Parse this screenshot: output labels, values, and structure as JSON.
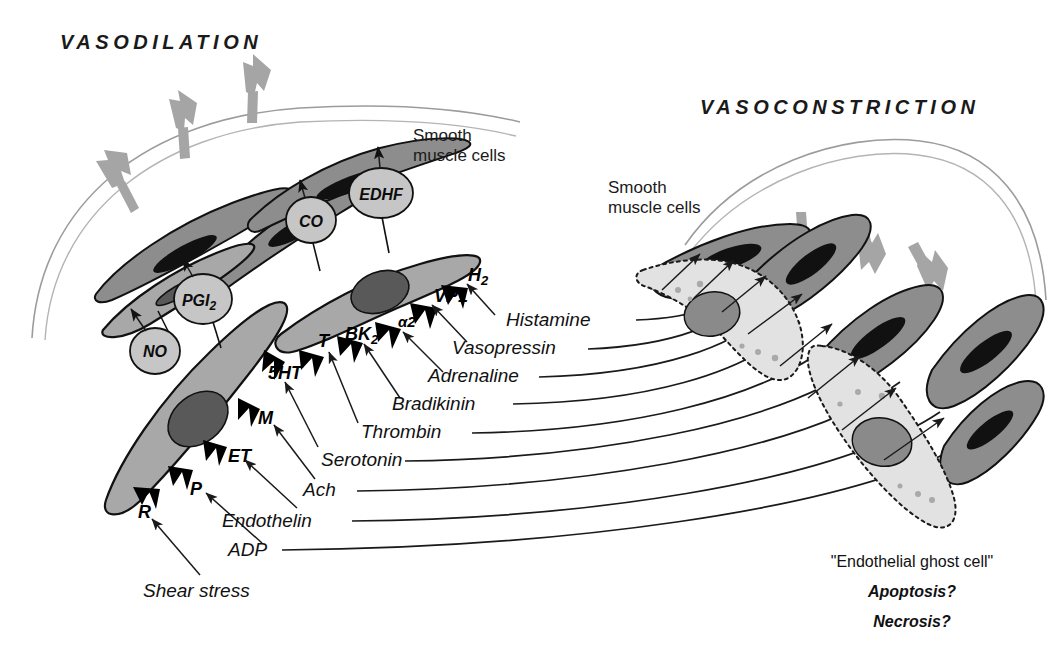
{
  "diagram": {
    "titles": {
      "left": "VASODILATION",
      "right": "VASOCONSTRICTION"
    },
    "annotations": {
      "smooth_muscle_left": [
        "Smooth",
        "muscle cells"
      ],
      "smooth_muscle_right": [
        "Smooth",
        "muscle cells"
      ],
      "ghost_cell": "\"Endothelial ghost cell\"",
      "ghost_q1": "Apoptosis?",
      "ghost_q2": "Necrosis?"
    },
    "mediators": [
      {
        "name": "NO",
        "label": "NO",
        "sub": ""
      },
      {
        "name": "PGI2",
        "label": "PGI",
        "sub": "2"
      },
      {
        "name": "CO",
        "label": "CO",
        "sub": ""
      },
      {
        "name": "EDHF",
        "label": "EDHF",
        "sub": ""
      }
    ],
    "receptors": [
      {
        "id": "R",
        "label": "R",
        "sub": ""
      },
      {
        "id": "P",
        "label": "P",
        "sub": ""
      },
      {
        "id": "ET",
        "label": "ET",
        "sub": ""
      },
      {
        "id": "M",
        "label": "M",
        "sub": ""
      },
      {
        "id": "5HT",
        "label": "5HT",
        "sub": ""
      },
      {
        "id": "T",
        "label": "T",
        "sub": ""
      },
      {
        "id": "BK2",
        "label": "BK",
        "sub": "2"
      },
      {
        "id": "a2",
        "label": "α2",
        "sub": ""
      },
      {
        "id": "VP1",
        "label": "VP1",
        "sub": ""
      },
      {
        "id": "H2",
        "label": "H",
        "sub": "2"
      }
    ],
    "ligands": [
      {
        "name": "Shear stress",
        "receptor": "R"
      },
      {
        "name": "ADP",
        "receptor": "P"
      },
      {
        "name": "Endothelin",
        "receptor": "ET"
      },
      {
        "name": "Ach",
        "receptor": "M"
      },
      {
        "name": "Serotonin",
        "receptor": "5HT"
      },
      {
        "name": "Thrombin",
        "receptor": "T"
      },
      {
        "name": "Bradikinin",
        "receptor": "BK2"
      },
      {
        "name": "Adrenaline",
        "receptor": "a2"
      },
      {
        "name": "Vasopressin",
        "receptor": "VP1"
      },
      {
        "name": "Histamine",
        "receptor": "H2"
      }
    ],
    "colors": {
      "smooth_muscle": "#8d8d8d",
      "endothelial": "#a8a8a8",
      "endothelial_nucleus": "#595959",
      "ghost_cell": "#e2e2e2",
      "mediator_bubble": "#c6c6c6",
      "flow_arrow": "#a5a5a5",
      "vessel_wall": "#9c9c9c",
      "receptor_spike": "#000000",
      "text": "#111111",
      "background": "#ffffff"
    },
    "flow_arrows": {
      "left_direction": "outward",
      "left_count": 3,
      "right_direction": "inward",
      "right_count": 3
    }
  }
}
